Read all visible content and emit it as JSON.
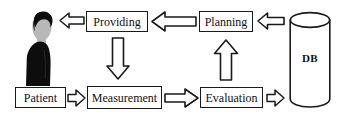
{
  "diagram": {
    "nodes": [
      {
        "id": "patient",
        "label": "Patient",
        "shape": "rectangle"
      },
      {
        "id": "measurement",
        "label": "Measurement",
        "shape": "rectangle"
      },
      {
        "id": "evaluation",
        "label": "Evaluation",
        "shape": "rectangle"
      },
      {
        "id": "planning",
        "label": "Planning",
        "shape": "rectangle"
      },
      {
        "id": "providing",
        "label": "Providing",
        "shape": "rectangle"
      },
      {
        "id": "db",
        "label": "DB",
        "shape": "cylinder"
      }
    ],
    "person": {
      "label": "",
      "description": "person-silhouette"
    },
    "edges": [
      {
        "from": "patient",
        "to": "measurement",
        "direction": "right"
      },
      {
        "from": "measurement",
        "to": "evaluation",
        "direction": "right"
      },
      {
        "from": "evaluation",
        "to": "db",
        "direction": "right"
      },
      {
        "from": "evaluation",
        "to": "planning",
        "direction": "up"
      },
      {
        "from": "db",
        "to": "planning",
        "direction": "left"
      },
      {
        "from": "planning",
        "to": "providing",
        "direction": "left"
      },
      {
        "from": "providing",
        "to": "measurement",
        "direction": "down"
      },
      {
        "from": "providing",
        "to": "person",
        "direction": "left"
      }
    ],
    "colors": {
      "stroke": "#1a1a1a",
      "fill": "#ffffff",
      "silhouette": "#0d0d0d",
      "skin": "#b5b5b5",
      "background": "#ffffff"
    }
  }
}
